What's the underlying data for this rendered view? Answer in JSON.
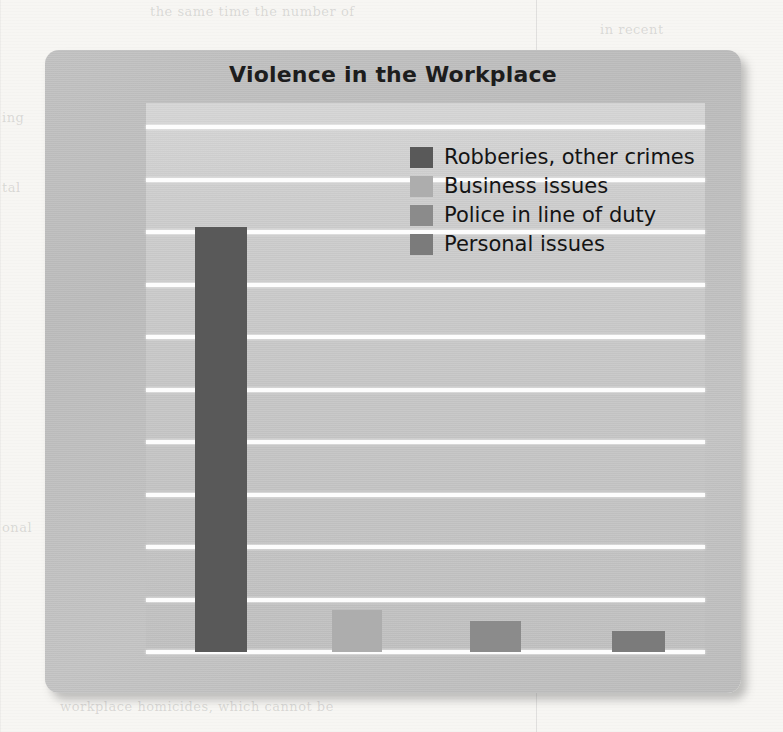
{
  "page": {
    "background_color": "#f7f6f3",
    "bleed_text": {
      "top": "the same time the number of",
      "top_right": "in recent",
      "left_1": "ing",
      "left_2": "tal",
      "left_3": "onal",
      "bottom": "workplace homicides, which cannot be"
    }
  },
  "panel": {
    "background_color": "#c0c0c0",
    "plot_background_color": "#c9c9c9",
    "gridline_color": "#fdfdfd"
  },
  "chart_data": {
    "type": "bar",
    "title": "Violence in the Workplace",
    "xlabel": "",
    "ylabel": "",
    "categories": [
      "Robberies, other crimes",
      "Business issues",
      "Police in line of duty",
      "Personal issues"
    ],
    "values": [
      81,
      8,
      6,
      4
    ],
    "value_labels": [
      "81%",
      "8%",
      "6%",
      "4%"
    ],
    "ylim": [
      0,
      100
    ],
    "ytick_labels": [
      "0%",
      "10%",
      "20%",
      "30%",
      "40%",
      "50%",
      "60%",
      "70%",
      "80%",
      "90%",
      "100%"
    ],
    "ytick_values": [
      0,
      10,
      20,
      30,
      40,
      50,
      60,
      70,
      80,
      90,
      100
    ],
    "grid": true,
    "grid_axis": "y",
    "legend_position": "upper right inside plot",
    "bar_colors": [
      "#595959",
      "#adadad",
      "#8b8b8b",
      "#7b7b7b"
    ],
    "series": [
      {
        "name": "Causes of workplace violence",
        "values": [
          81,
          8,
          6,
          4
        ]
      }
    ]
  },
  "legend": {
    "items": [
      {
        "label": "Robberies, other crimes",
        "color": "#595959"
      },
      {
        "label": "Business issues",
        "color": "#adadad"
      },
      {
        "label": "Police in line of duty",
        "color": "#8b8b8b"
      },
      {
        "label": "Personal issues",
        "color": "#7b7b7b"
      }
    ]
  }
}
